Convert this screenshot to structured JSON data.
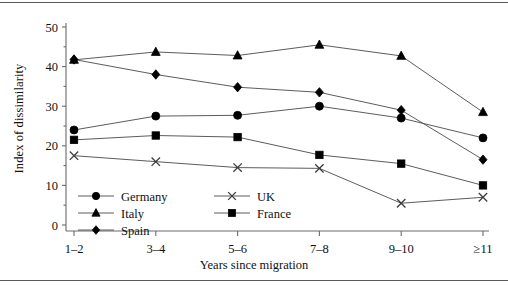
{
  "chart_data": {
    "type": "line",
    "title": "",
    "xlabel": "Years since migration",
    "ylabel": "Index of dissimilarity",
    "categories": [
      "1–2",
      "3–4",
      "5–6",
      "7–8",
      "9–10",
      "≥11"
    ],
    "ylim": [
      0,
      50
    ],
    "yticks": [
      0,
      10,
      20,
      30,
      40,
      50
    ],
    "ytick_labels": [
      "0",
      "10",
      "20",
      "30",
      "40",
      "50"
    ],
    "minor_ticks": true,
    "grid": false,
    "legend_position": "inside-lower-left",
    "series": [
      {
        "name": "Germany",
        "marker": "circle",
        "values": [
          24.0,
          27.5,
          27.7,
          30.0,
          27.0,
          22.0
        ]
      },
      {
        "name": "Italy",
        "marker": "triangle",
        "values": [
          41.7,
          43.7,
          42.8,
          45.5,
          42.7,
          28.5
        ]
      },
      {
        "name": "Spain",
        "marker": "diamond",
        "values": [
          41.8,
          38.0,
          34.8,
          33.5,
          29.0,
          16.5
        ]
      },
      {
        "name": "UK",
        "marker": "cross",
        "values": [
          17.5,
          16.0,
          14.5,
          14.3,
          5.5,
          7.0
        ]
      },
      {
        "name": "France",
        "marker": "square",
        "values": [
          21.5,
          22.6,
          22.2,
          17.7,
          15.5,
          10.0
        ]
      }
    ]
  },
  "legend": {
    "entries": [
      {
        "label": "Germany",
        "marker": "circle"
      },
      {
        "label": "UK",
        "marker": "cross"
      },
      {
        "label": "Italy",
        "marker": "triangle"
      },
      {
        "label": "France",
        "marker": "square"
      },
      {
        "label": "Spain",
        "marker": "diamond"
      }
    ]
  },
  "colors": {
    "line": "#4a4a4a",
    "marker": "#000000",
    "axis": "#6b6b6b",
    "rule": "#5a5a5a",
    "background": "#ffffff"
  }
}
